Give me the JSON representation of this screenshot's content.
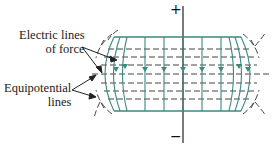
{
  "labels": {
    "force_line1": "Electric lines",
    "force_line2": "of force",
    "equi_line1": "Equipotential",
    "equi_line2": "lines"
  },
  "signs": {
    "plus": "+",
    "minus": "−"
  },
  "colors": {
    "field": "#3a8a7e",
    "dash": "#444444",
    "axis": "#222222"
  }
}
